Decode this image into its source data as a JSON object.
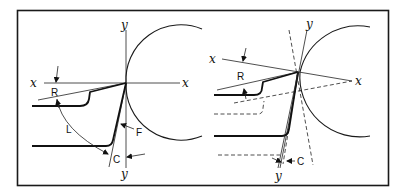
{
  "figure": {
    "left_panel": {
      "labels": {
        "x_axis_left": "x",
        "x_axis_right": "x",
        "y_axis_top": "y",
        "y_axis_bottom": "y",
        "rake_angle": "R",
        "lip_angle": "L",
        "flank": "F",
        "clearance_angle": "C"
      }
    },
    "right_panel": {
      "labels": {
        "x_axis_left": "x",
        "x_axis_right": "x",
        "y_axis_top": "y",
        "y_axis_bottom": "y",
        "rake_angle": "R",
        "clearance_angle": "C"
      }
    }
  }
}
